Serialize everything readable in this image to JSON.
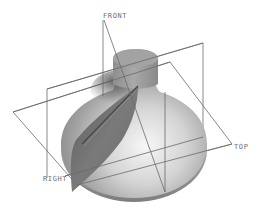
{
  "view": {
    "description": "Isometric 3D CAD model view with datum planes",
    "background": "#ffffff"
  },
  "model": {
    "name": "bell-shaped revolved solid with slanted fin",
    "body_color": "#b9b9b9",
    "shadow_color": "#5e5e5e",
    "highlight_color": "#f4f4f4",
    "fin_color": "#6f6f6f"
  },
  "datum_planes": [
    {
      "id": "front",
      "label": "FRONT",
      "label_pos": [
        103,
        18
      ]
    },
    {
      "id": "right",
      "label": "RIGHT",
      "label_pos": [
        43,
        181
      ]
    },
    {
      "id": "top",
      "label": "TOP",
      "label_pos": [
        234,
        149
      ]
    }
  ],
  "colors": {
    "datum_line": "#6a6a6a",
    "datum_label": "#6f6f6f"
  }
}
